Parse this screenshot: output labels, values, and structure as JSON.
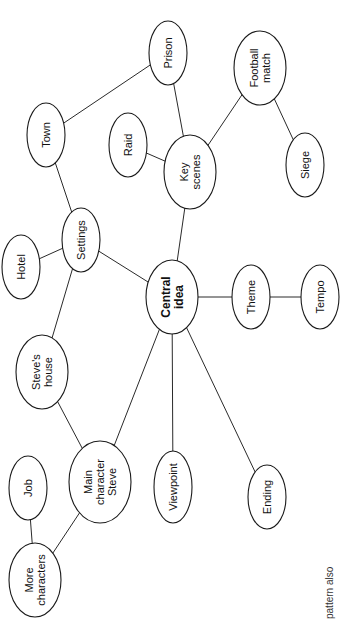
{
  "diagram": {
    "type": "mind-map",
    "orientation": "rotated-90-ccw",
    "colors": {
      "line": "#2a2a2a",
      "node_fill": "#ffffff",
      "node_stroke": "#1a1a1a",
      "text": "#111111"
    },
    "nodes": [
      {
        "id": "central",
        "lines": [
          "Central",
          "idea"
        ],
        "bold": true,
        "cx": 172,
        "cy": 297,
        "rx": 26,
        "ry": 37
      },
      {
        "id": "key_scenes",
        "lines": [
          "Key",
          "scenes"
        ],
        "bold": false,
        "cx": 190,
        "cy": 172,
        "rx": 26,
        "ry": 37
      },
      {
        "id": "prison",
        "lines": [
          "Prison"
        ],
        "bold": false,
        "cx": 168,
        "cy": 53,
        "rx": 19,
        "ry": 32
      },
      {
        "id": "raid",
        "lines": [
          "Raid"
        ],
        "bold": false,
        "cx": 128,
        "cy": 145,
        "rx": 19,
        "ry": 32
      },
      {
        "id": "football_match",
        "lines": [
          "Football",
          "match"
        ],
        "bold": false,
        "cx": 260,
        "cy": 68,
        "rx": 26,
        "ry": 37
      },
      {
        "id": "siege",
        "lines": [
          "Siege"
        ],
        "bold": false,
        "cx": 305,
        "cy": 165,
        "rx": 19,
        "ry": 32
      },
      {
        "id": "theme",
        "lines": [
          "Theme"
        ],
        "bold": false,
        "cx": 251,
        "cy": 297,
        "rx": 19,
        "ry": 32
      },
      {
        "id": "tempo",
        "lines": [
          "Tempo"
        ],
        "bold": false,
        "cx": 320,
        "cy": 297,
        "rx": 19,
        "ry": 32
      },
      {
        "id": "settings",
        "lines": [
          "Settings"
        ],
        "bold": false,
        "cx": 81,
        "cy": 240,
        "rx": 19,
        "ry": 32
      },
      {
        "id": "town",
        "lines": [
          "Town"
        ],
        "bold": false,
        "cx": 46,
        "cy": 135,
        "rx": 19,
        "ry": 32
      },
      {
        "id": "hotel",
        "lines": [
          "Hotel"
        ],
        "bold": false,
        "cx": 21,
        "cy": 267,
        "rx": 19,
        "ry": 32
      },
      {
        "id": "steves_house",
        "lines": [
          "Steve's",
          "house"
        ],
        "bold": false,
        "cx": 42,
        "cy": 372,
        "rx": 26,
        "ry": 37
      },
      {
        "id": "main_character",
        "lines": [
          "Main",
          "character",
          "Steve"
        ],
        "bold": false,
        "cx": 100,
        "cy": 482,
        "rx": 31,
        "ry": 41
      },
      {
        "id": "job",
        "lines": [
          "Job"
        ],
        "bold": false,
        "cx": 28,
        "cy": 488,
        "rx": 19,
        "ry": 32
      },
      {
        "id": "more_characters",
        "lines": [
          "More",
          "characters"
        ],
        "bold": false,
        "cx": 35,
        "cy": 580,
        "rx": 26,
        "ry": 37
      },
      {
        "id": "viewpoint",
        "lines": [
          "Viewpoint"
        ],
        "bold": false,
        "cx": 173,
        "cy": 487,
        "rx": 19,
        "ry": 36
      },
      {
        "id": "ending",
        "lines": [
          "Ending"
        ],
        "bold": false,
        "cx": 267,
        "cy": 497,
        "rx": 19,
        "ry": 32
      }
    ],
    "edges": [
      [
        "central",
        "key_scenes"
      ],
      [
        "central",
        "theme"
      ],
      [
        "theme",
        "tempo"
      ],
      [
        "central",
        "settings"
      ],
      [
        "central",
        "main_character"
      ],
      [
        "central",
        "viewpoint"
      ],
      [
        "central",
        "ending"
      ],
      [
        "key_scenes",
        "prison"
      ],
      [
        "key_scenes",
        "raid"
      ],
      [
        "key_scenes",
        "football_match"
      ],
      [
        "football_match",
        "siege"
      ],
      [
        "settings",
        "town"
      ],
      [
        "town",
        "prison"
      ],
      [
        "settings",
        "hotel"
      ],
      [
        "settings",
        "steves_house"
      ],
      [
        "steves_house",
        "main_character"
      ],
      [
        "main_character",
        "more_characters"
      ],
      [
        "more_characters",
        "job"
      ]
    ],
    "caption": {
      "text": "pattern also",
      "x": 333,
      "y": 619,
      "cut_off": true
    }
  }
}
